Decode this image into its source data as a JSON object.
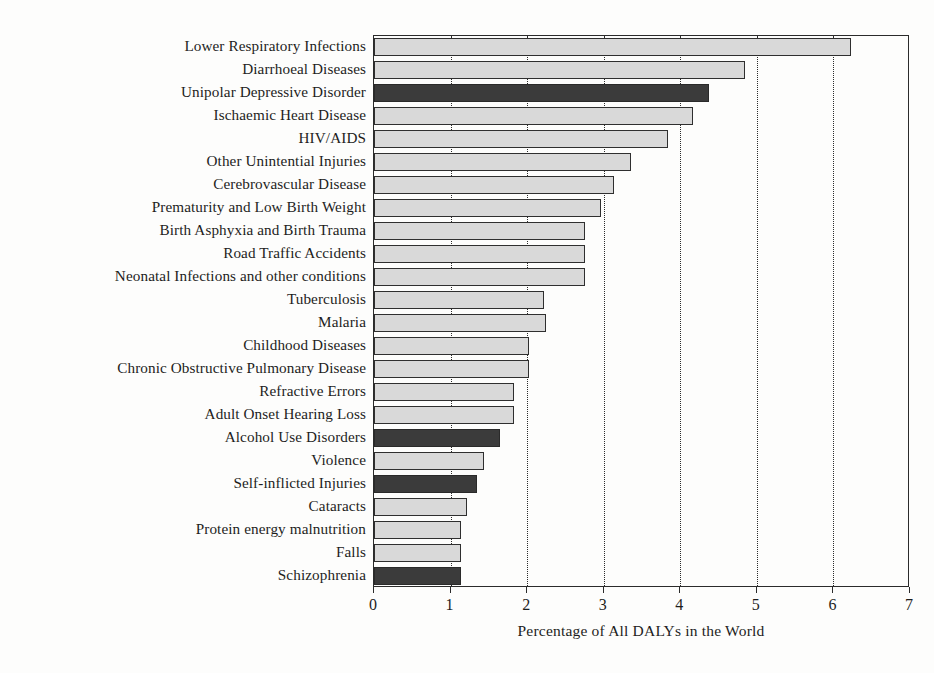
{
  "chart_data": {
    "type": "bar",
    "orientation": "horizontal",
    "title": "",
    "xlabel": "Percentage of All DALYs in the World",
    "ylabel": "",
    "xlim": [
      0,
      7
    ],
    "xticks": [
      0,
      1,
      2,
      3,
      4,
      5,
      6,
      7
    ],
    "xtick_labels": [
      "0",
      "1",
      "2",
      "3",
      "4",
      "5",
      "6",
      "7"
    ],
    "grid": "vertical-dotted",
    "legend": "none",
    "colors": {
      "light_bar": "#d9d9d9",
      "dark_bar": "#3b3b3b",
      "bar_edge": "#2f2f2f",
      "axis": "#2b2b2b",
      "text": "#1d1d1d",
      "background": "#fdfdfc"
    },
    "categories": [
      "Lower Respiratory Infections",
      "Diarrhoeal Diseases",
      "Unipolar Depressive Disorder",
      "Ischaemic Heart Disease",
      "HIV/AIDS",
      "Other Unintential Injuries",
      "Cerebrovascular Disease",
      "Prematurity and Low Birth Weight",
      "Birth Asphyxia and Birth Trauma",
      "Road Traffic Accidents",
      "Neonatal Infections and other conditions",
      "Tuberculosis",
      "Malaria",
      "Childhood Diseases",
      "Chronic Obstructive Pulmonary Disease",
      "Refractive Errors",
      "Adult Onset Hearing Loss",
      "Alcohol Use Disorders",
      "Violence",
      "Self-inflicted Injuries",
      "Cataracts",
      "Protein energy malnutrition",
      "Falls",
      "Schizophrenia"
    ],
    "values": [
      6.23,
      4.84,
      4.37,
      4.16,
      3.84,
      3.35,
      3.13,
      2.96,
      2.75,
      2.75,
      2.75,
      2.22,
      2.25,
      2.02,
      2.02,
      1.83,
      1.83,
      1.65,
      1.44,
      1.35,
      1.22,
      1.13,
      1.13,
      1.13
    ],
    "highlight": [
      false,
      false,
      true,
      false,
      false,
      false,
      false,
      false,
      false,
      false,
      false,
      false,
      false,
      false,
      false,
      false,
      false,
      true,
      false,
      true,
      false,
      false,
      false,
      true
    ]
  }
}
